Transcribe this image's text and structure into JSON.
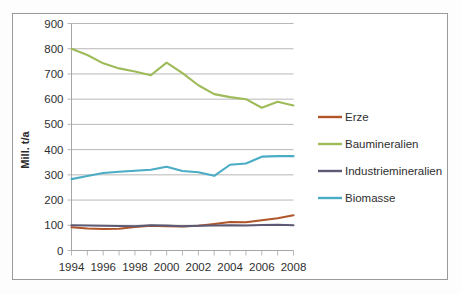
{
  "chart_data": {
    "type": "line",
    "title": "",
    "xlabel": "",
    "ylabel": "Mill. t/a",
    "xlim": [
      1994,
      2008
    ],
    "ylim": [
      0,
      900
    ],
    "ytick_step": 100,
    "yticks": [
      "0",
      "100",
      "200",
      "300",
      "400",
      "500",
      "600",
      "700",
      "800",
      "900"
    ],
    "x": [
      1994,
      1995,
      1996,
      1997,
      1998,
      1999,
      2000,
      2001,
      2002,
      2003,
      2004,
      2005,
      2006,
      2007,
      2008
    ],
    "xtick_labels": [
      "1994",
      "1996",
      "1998",
      "2000",
      "2002",
      "2004",
      "2006",
      "2008"
    ],
    "xtick_values": [
      1994,
      1996,
      1998,
      2000,
      2002,
      2004,
      2006,
      2008
    ],
    "grid": true,
    "legend_position": "right",
    "series": [
      {
        "name": "Erze",
        "color": "#b0562b",
        "values": [
          92,
          87,
          85,
          86,
          93,
          98,
          96,
          95,
          98,
          105,
          113,
          112,
          120,
          128,
          140
        ]
      },
      {
        "name": "Baumineralien",
        "color": "#9ebb59",
        "values": [
          800,
          775,
          742,
          722,
          710,
          695,
          745,
          703,
          655,
          620,
          608,
          600,
          566,
          590,
          575
        ]
      },
      {
        "name": "Industriemineralien",
        "color": "#5c5a74",
        "values": [
          100,
          99,
          98,
          97,
          96,
          100,
          99,
          96,
          98,
          99,
          100,
          99,
          101,
          102,
          100
        ]
      },
      {
        "name": "Biomasse",
        "color": "#4aacc5",
        "values": [
          283,
          295,
          307,
          312,
          316,
          320,
          332,
          315,
          310,
          296,
          340,
          345,
          372,
          374,
          374
        ]
      }
    ]
  },
  "legend": {
    "items": [
      {
        "label": "Erze",
        "color": "#b0562b"
      },
      {
        "label": "Baumineralien",
        "color": "#9ebb59"
      },
      {
        "label": "Industriemineralien",
        "color": "#5c5a74"
      },
      {
        "label": "Biomasse",
        "color": "#4aacc5"
      }
    ]
  }
}
